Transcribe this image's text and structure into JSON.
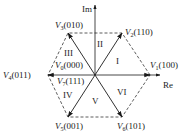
{
  "diagram": {
    "type": "space-vector-hexagon",
    "axes": {
      "imag_label": "Im",
      "real_label": "Re"
    },
    "center": [
      95,
      75
    ],
    "vectors": [
      {
        "id": "V1",
        "name": "V",
        "sub": "1",
        "state": "(100)",
        "tip": [
          150,
          75
        ],
        "label_pos": [
          150,
          68
        ]
      },
      {
        "id": "V2",
        "name": "V",
        "sub": "2",
        "state": "(110)",
        "tip": [
          122,
          33
        ],
        "label_pos": [
          125,
          35
        ]
      },
      {
        "id": "V3",
        "name": "V",
        "sub": "3",
        "state": "(010)",
        "tip": [
          68,
          33
        ],
        "label_pos": [
          55,
          28
        ]
      },
      {
        "id": "V4",
        "name": "V",
        "sub": "4",
        "state": "(011)",
        "tip": [
          48,
          75
        ],
        "label_pos": [
          3,
          78
        ]
      },
      {
        "id": "V5",
        "name": "V",
        "sub": "5",
        "state": "(001)",
        "tip": [
          68,
          117
        ],
        "label_pos": [
          55,
          129
        ]
      },
      {
        "id": "V6",
        "name": "V",
        "sub": "6",
        "state": "(101)",
        "tip": [
          122,
          117
        ],
        "label_pos": [
          117,
          129
        ]
      }
    ],
    "zero_vectors": [
      {
        "id": "V0",
        "name": "V",
        "sub": "0",
        "state": "(000)",
        "label_pos": [
          55,
          68
        ]
      },
      {
        "id": "V7",
        "name": "V",
        "sub": "7",
        "state": "(111)",
        "label_pos": [
          57,
          84
        ]
      }
    ],
    "sectors": [
      {
        "id": "I",
        "label": "I",
        "pos": [
          116,
          64
        ]
      },
      {
        "id": "II",
        "label": "II",
        "pos": [
          97,
          47
        ]
      },
      {
        "id": "III",
        "label": "III",
        "pos": [
          64,
          56
        ]
      },
      {
        "id": "IV",
        "label": "IV",
        "pos": [
          63,
          98
        ]
      },
      {
        "id": "V",
        "label": "V",
        "pos": [
          92,
          104
        ]
      },
      {
        "id": "VI",
        "label": "VI",
        "pos": [
          117,
          95
        ]
      }
    ],
    "colors": {
      "line": "#1a1a1a",
      "dashed": "#333333"
    }
  }
}
